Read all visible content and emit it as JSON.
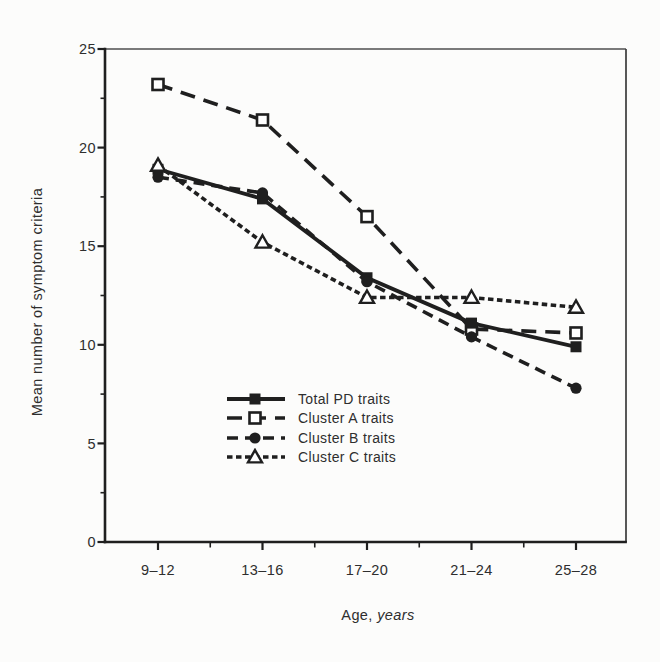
{
  "colors": {
    "ink": "#1f1f1f",
    "frame_thin": "#4f4f4f",
    "frame_right": "#3a3a3a",
    "text": "#2e2e2e",
    "background": "#fcfcfb",
    "open_marker_fill": "#ffffff"
  },
  "chart_data": {
    "type": "line",
    "title": "",
    "xlabel_regular": "Age,",
    "xlabel_italic": "years",
    "ylabel": "Mean number of symptom criteria",
    "categories": [
      "9–12",
      "13–16",
      "17–20",
      "21–24",
      "25–28"
    ],
    "yticks": [
      0,
      5,
      10,
      15,
      20,
      25
    ],
    "y_minor_step": 2.5,
    "ylim": [
      0,
      25
    ],
    "grid": false,
    "legend_position": "inside-lower-middle",
    "series": [
      {
        "name": "Total PD traits",
        "marker": "filled-square",
        "line": "solid",
        "values": [
          18.9,
          17.4,
          13.4,
          11.1,
          9.9
        ]
      },
      {
        "name": "Cluster A traits",
        "marker": "open-square",
        "line": "long-dash",
        "values": [
          23.2,
          21.4,
          16.5,
          10.8,
          10.6
        ]
      },
      {
        "name": "Cluster B traits",
        "marker": "filled-circle",
        "line": "dash",
        "values": [
          18.5,
          17.7,
          13.2,
          10.4,
          7.8
        ]
      },
      {
        "name": "Cluster C traits",
        "marker": "open-triangle",
        "line": "short-dash",
        "values": [
          19.1,
          15.2,
          12.4,
          12.4,
          11.9
        ]
      }
    ]
  }
}
